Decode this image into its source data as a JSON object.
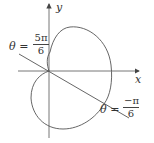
{
  "axes": {
    "x_label": "x",
    "y_label": "y"
  },
  "lines": [
    {
      "theta_symbol": "θ",
      "equals": "=",
      "numerator": "5π",
      "denominator": "6"
    },
    {
      "theta_symbol": "θ",
      "equals": "=",
      "numerator": "−π",
      "denominator": "6"
    }
  ],
  "colors": {
    "stroke": "#555555",
    "text": "#333333"
  }
}
